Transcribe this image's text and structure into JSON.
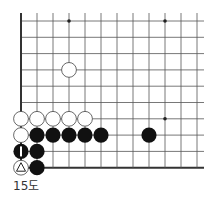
{
  "diagram": {
    "caption": "15도",
    "grid": {
      "origin_x": 21,
      "origin_y": 21,
      "spacing_x": 16,
      "spacing_y": 16.3,
      "cols": 12,
      "rows": 10,
      "edges": [
        "left",
        "bottom"
      ],
      "line_color": "#555555",
      "edge_color": "#333333"
    },
    "star_points": [
      {
        "col": 3,
        "row": 0
      },
      {
        "col": 9,
        "row": 0
      },
      {
        "col": 9,
        "row": 6
      }
    ],
    "stones": [
      {
        "color": "white",
        "col": 3,
        "row": 3
      },
      {
        "color": "white",
        "col": 0,
        "row": 6
      },
      {
        "color": "white",
        "col": 1,
        "row": 6
      },
      {
        "color": "white",
        "col": 2,
        "row": 6
      },
      {
        "color": "white",
        "col": 3,
        "row": 6
      },
      {
        "color": "white",
        "col": 4,
        "row": 6
      },
      {
        "color": "white",
        "col": 0,
        "row": 7
      },
      {
        "color": "black",
        "col": 1,
        "row": 7
      },
      {
        "color": "black",
        "col": 2,
        "row": 7
      },
      {
        "color": "black",
        "col": 3,
        "row": 7
      },
      {
        "color": "black",
        "col": 4,
        "row": 7
      },
      {
        "color": "black",
        "col": 5,
        "row": 7
      },
      {
        "color": "black",
        "col": 8,
        "row": 7
      },
      {
        "color": "black",
        "col": 0,
        "row": 8,
        "mark": "I"
      },
      {
        "color": "black",
        "col": 1,
        "row": 8
      },
      {
        "color": "white",
        "col": 0,
        "row": 9,
        "mark": "triangle"
      },
      {
        "color": "black",
        "col": 1,
        "row": 9
      }
    ]
  }
}
